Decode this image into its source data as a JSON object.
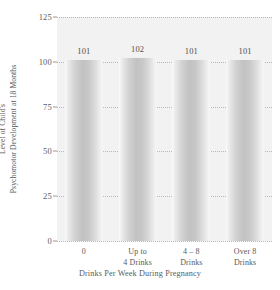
{
  "chart_data": {
    "type": "bar",
    "title": "",
    "subtitle": "",
    "xlabel": "Drinks Per Week During Pregnancy",
    "ylabel_line1": "Level of Child's",
    "ylabel_line2": "Psychomotor Development at 18 Months",
    "categories": [
      "0",
      "Up to 4 Drinks",
      "4 – 8 Drinks",
      "Over 8 Drinks"
    ],
    "category_lines": [
      [
        "0"
      ],
      [
        "Up to",
        "4 Drinks"
      ],
      [
        "4 – 8",
        "Drinks"
      ],
      [
        "Over 8",
        "Drinks"
      ]
    ],
    "values": [
      101,
      102,
      101,
      101
    ],
    "value_labels": [
      "101",
      "102",
      "101",
      "101"
    ],
    "ylim": [
      0,
      125
    ],
    "yticks": [
      0,
      25,
      50,
      75,
      100,
      125
    ],
    "ytick_labels": [
      "0",
      "25",
      "50",
      "75",
      "100",
      "125"
    ],
    "grid": true,
    "grid_style": "dotted",
    "legend": "none",
    "colors": {
      "panel_background": "#f2f2f2",
      "bar_light": "#fbfbfb",
      "bar_dark": "#c2c2c2",
      "gridline": "#b9b9b9",
      "text": "#5a5a5a",
      "page_background": "#ffffff"
    }
  }
}
